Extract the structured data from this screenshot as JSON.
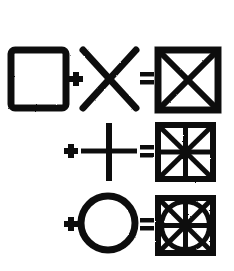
{
  "figure": {
    "background_color": "#ffffff",
    "ink_color": "#111111",
    "width": 234,
    "height": 271
  },
  "operators": {
    "plus": "+",
    "equals": "="
  },
  "rows": [
    {
      "id": "row-1",
      "label": "square plus diagonals equals square with X",
      "operand_a": {
        "name": "square",
        "shape": "square",
        "x": 11,
        "y": 50,
        "w": 55,
        "h": 58,
        "stroke": 7
      },
      "operator_1": {
        "symbol": "+",
        "x": 72,
        "y": 79,
        "size": 26
      },
      "operand_b": {
        "name": "diagonal-cross",
        "shape": "x-cross",
        "x": 82,
        "y": 49,
        "w": 55,
        "h": 60,
        "stroke": 7
      },
      "operator_2": {
        "symbol": "=",
        "x": 146,
        "y": 79,
        "size": 26
      },
      "result": {
        "name": "square-with-diagonals",
        "x": 158,
        "y": 50,
        "w": 60,
        "h": 60,
        "stroke": 7,
        "parts": [
          "square",
          "diagonals"
        ]
      }
    },
    {
      "id": "row-2",
      "label": "plus cross equals square with diagonals and cross",
      "operator_1": {
        "symbol": "+",
        "x": 70,
        "y": 151,
        "size": 26
      },
      "operand_b": {
        "name": "upright-cross",
        "shape": "plus-cross",
        "x": 81,
        "y": 123,
        "w": 55,
        "h": 57,
        "stroke": 6
      },
      "operator_2": {
        "symbol": "=",
        "x": 146,
        "y": 151,
        "size": 26
      },
      "result": {
        "name": "square-with-diagonals-and-cross",
        "x": 158,
        "y": 125,
        "w": 55,
        "h": 54,
        "stroke": 6,
        "parts": [
          "square",
          "diagonals",
          "cross"
        ]
      }
    },
    {
      "id": "row-3",
      "label": "plus circle equals square with diagonals cross and inscribed circle",
      "operator_1": {
        "symbol": "+",
        "x": 70,
        "y": 224,
        "size": 26
      },
      "operand_b": {
        "name": "circle",
        "shape": "circle",
        "cx": 108,
        "cy": 223,
        "r": 27,
        "stroke": 7
      },
      "operator_2": {
        "symbol": "=",
        "x": 146,
        "y": 224,
        "size": 26
      },
      "result": {
        "name": "square-with-diagonals-cross-and-circle",
        "x": 158,
        "y": 198,
        "w": 55,
        "h": 55,
        "stroke": 6,
        "parts": [
          "square",
          "diagonals",
          "cross",
          "inscribed-circle"
        ]
      }
    }
  ]
}
